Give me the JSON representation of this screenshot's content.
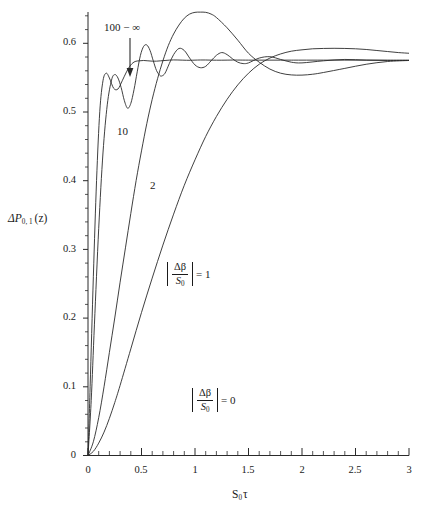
{
  "axes": {
    "y_label": "ΔP",
    "y_label_sub": "0, 1",
    "y_label_arg": "(z)",
    "x_label_main": "S",
    "x_label_sub": "0",
    "x_label_tau": "τ",
    "x_ticks": [
      "0",
      "0.5",
      "1",
      "1.5",
      "2",
      "2.5",
      "3"
    ],
    "y_ticks": [
      "0",
      "0.1",
      "0.2",
      "0.3",
      "0.4",
      "0.5",
      "0.6"
    ],
    "x_range": [
      0,
      3
    ],
    "y_range": [
      0,
      0.645
    ],
    "x_minor_per_major": 5,
    "y_minor_per_major": 5,
    "grid": false
  },
  "annotations": {
    "top_label": "100 − ∞",
    "curve_10": "10",
    "curve_2": "2",
    "ratio_numerator": "Δβ",
    "ratio_denominator": "S",
    "ratio_denominator_sub": "0",
    "eq_one": "= 1",
    "eq_zero": "= 0"
  },
  "chart_data": {
    "type": "line",
    "title": "",
    "xlabel": "S_0 τ",
    "ylabel": "ΔP_{0,1}(z)",
    "xlim": [
      0,
      3
    ],
    "ylim": [
      0,
      0.645
    ],
    "grid": false,
    "legend": "inline curve labels",
    "asymptote": 0.575,
    "series": [
      {
        "name": "100 − ∞",
        "label": "100 − ∞",
        "comment": "strongly oscillating, fastest rise, damped ripples about 0.575",
        "x": [
          0,
          0.02,
          0.05,
          0.08,
          0.11,
          0.14,
          0.17,
          0.2,
          0.24,
          0.28,
          0.32,
          0.36,
          0.4,
          0.44,
          0.48,
          0.52,
          0.56,
          0.6,
          0.64,
          0.68,
          0.72,
          0.76,
          0.8,
          0.84,
          0.88,
          0.92,
          0.96,
          1.0,
          1.05,
          1.1,
          1.15,
          1.2,
          1.25,
          1.3,
          1.35,
          1.4,
          1.5,
          1.6,
          1.7,
          1.8,
          1.9,
          2.0,
          2.2,
          2.4,
          2.6,
          2.8,
          3.0
        ],
        "y": [
          0,
          0.1,
          0.26,
          0.4,
          0.5,
          0.545,
          0.556,
          0.549,
          0.534,
          0.533,
          0.545,
          0.558,
          0.568,
          0.573,
          0.574,
          0.5745,
          0.574,
          0.5735,
          0.5735,
          0.574,
          0.5745,
          0.575,
          0.5753,
          0.5752,
          0.575,
          0.5748,
          0.5748,
          0.575,
          0.5752,
          0.5752,
          0.575,
          0.5749,
          0.5749,
          0.575,
          0.5751,
          0.5751,
          0.575,
          0.575,
          0.575,
          0.575,
          0.575,
          0.575,
          0.575,
          0.575,
          0.575,
          0.575,
          0.575
        ]
      },
      {
        "name": "10",
        "label": "10",
        "comment": "oscillating with visible ripples: first peak ~0.554 near 0.25, dip ~0.505 near 0.37, peak ~0.597 near 0.55, dip ~0.553 near 0.69, then decaying ripples to 0.575",
        "x": [
          0,
          0.03,
          0.06,
          0.1,
          0.14,
          0.18,
          0.22,
          0.25,
          0.28,
          0.31,
          0.34,
          0.37,
          0.4,
          0.43,
          0.46,
          0.49,
          0.52,
          0.55,
          0.58,
          0.61,
          0.64,
          0.67,
          0.69,
          0.72,
          0.76,
          0.8,
          0.85,
          0.9,
          0.95,
          1.0,
          1.05,
          1.1,
          1.15,
          1.2,
          1.25,
          1.3,
          1.35,
          1.4,
          1.45,
          1.5,
          1.6,
          1.7,
          1.8,
          1.9,
          2.0,
          2.2,
          2.4,
          2.6,
          2.8,
          3.0
        ],
        "y": [
          0,
          0.08,
          0.19,
          0.33,
          0.44,
          0.51,
          0.546,
          0.554,
          0.549,
          0.535,
          0.516,
          0.505,
          0.512,
          0.532,
          0.558,
          0.582,
          0.595,
          0.597,
          0.589,
          0.574,
          0.56,
          0.553,
          0.552,
          0.556,
          0.57,
          0.583,
          0.592,
          0.589,
          0.578,
          0.568,
          0.564,
          0.566,
          0.574,
          0.582,
          0.586,
          0.583,
          0.577,
          0.572,
          0.57,
          0.571,
          0.578,
          0.58,
          0.576,
          0.572,
          0.571,
          0.574,
          0.576,
          0.575,
          0.5745,
          0.5745
        ]
      },
      {
        "name": "2",
        "label": "2",
        "comment": "single broad overshoot peaking ~0.645 near 1.1 then undershoot ~0.553 near 2.0 and relax to ~0.575",
        "x": [
          0,
          0.05,
          0.1,
          0.15,
          0.2,
          0.25,
          0.3,
          0.35,
          0.4,
          0.45,
          0.5,
          0.55,
          0.6,
          0.65,
          0.7,
          0.75,
          0.8,
          0.85,
          0.9,
          0.95,
          1.0,
          1.05,
          1.1,
          1.15,
          1.2,
          1.3,
          1.4,
          1.5,
          1.6,
          1.7,
          1.8,
          1.9,
          2.0,
          2.1,
          2.2,
          2.4,
          2.6,
          2.8,
          3.0
        ],
        "y": [
          0,
          0.02,
          0.055,
          0.1,
          0.15,
          0.2,
          0.252,
          0.302,
          0.352,
          0.4,
          0.443,
          0.483,
          0.518,
          0.548,
          0.574,
          0.596,
          0.613,
          0.626,
          0.636,
          0.642,
          0.6445,
          0.6448,
          0.6445,
          0.642,
          0.637,
          0.622,
          0.604,
          0.585,
          0.572,
          0.562,
          0.556,
          0.5535,
          0.5532,
          0.5545,
          0.557,
          0.563,
          0.569,
          0.573,
          0.5745
        ]
      },
      {
        "name": "|Δβ/S0| = 1",
        "label": "|Δβ/S₀| = 1",
        "comment": "slowest monotone rise, saturating toward ~0.592 then easing to 0.58",
        "x": [
          0,
          0.05,
          0.1,
          0.15,
          0.2,
          0.25,
          0.3,
          0.4,
          0.5,
          0.6,
          0.7,
          0.8,
          0.9,
          1.0,
          1.1,
          1.2,
          1.3,
          1.4,
          1.5,
          1.6,
          1.7,
          1.8,
          1.9,
          2.0,
          2.1,
          2.2,
          2.3,
          2.4,
          2.5,
          2.6,
          2.7,
          2.8,
          2.9,
          3.0
        ],
        "y": [
          0,
          0.006,
          0.018,
          0.034,
          0.054,
          0.077,
          0.102,
          0.155,
          0.208,
          0.258,
          0.306,
          0.351,
          0.393,
          0.43,
          0.464,
          0.493,
          0.518,
          0.539,
          0.556,
          0.569,
          0.578,
          0.584,
          0.588,
          0.59,
          0.5915,
          0.592,
          0.5922,
          0.592,
          0.5915,
          0.5905,
          0.589,
          0.5875,
          0.586,
          0.585
        ]
      },
      {
        "name": "|Δβ/S0| = 0",
        "label": "|Δβ/S₀| = 0",
        "comment": "flat baseline along y = 0 (x axis)",
        "x": [
          0,
          3
        ],
        "y": [
          0,
          0
        ]
      }
    ]
  }
}
